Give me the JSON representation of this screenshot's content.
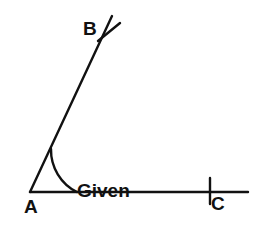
{
  "figure": {
    "title": "Given angle",
    "background_color": "#ffffff",
    "stroke_color": "#111111",
    "canvas": {
      "width": 263,
      "height": 234
    },
    "vertex_labels": {
      "a": "A",
      "b": "B",
      "c": "C"
    },
    "annotation": {
      "line1": "Given",
      "line2": "angle"
    },
    "geometry": {
      "vertex_a": {
        "x": 30,
        "y": 192
      },
      "ray_ab_end": {
        "x": 112,
        "y": 16
      },
      "ray_ac_end": {
        "x": 248,
        "y": 192
      },
      "arc_radius": 47,
      "arc_start_on_ab": {
        "x": 51,
        "y": 147
      },
      "arc_end_on_ac": {
        "x": 77,
        "y": 192
      },
      "tick_on_ab": {
        "x1": 99,
        "y1": 40,
        "x2": 119,
        "y2": 24
      },
      "tick_on_ac": {
        "x": 210,
        "y1": 178,
        "y2": 204
      },
      "line_width": 2.4,
      "angle_degrees": 65
    }
  }
}
